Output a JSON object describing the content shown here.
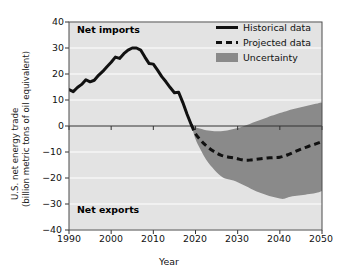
{
  "chart_data": {
    "type": "line",
    "title": "",
    "xlabel": "Year",
    "ylabel": "U.S. net energy trade (billion metric tons of oil equivalent)",
    "ylabel_line1": "U.S. net energy trade",
    "ylabel_line2": "(billion metric tons of oil equivalent)",
    "xlim": [
      1990,
      2050
    ],
    "ylim": [
      -40,
      40
    ],
    "xticks": [
      1990,
      2000,
      2010,
      2020,
      2030,
      2040,
      2050
    ],
    "yticks": [
      40,
      30,
      20,
      10,
      0,
      -10,
      -20,
      -30,
      -40
    ],
    "xtick_labels": [
      "1990",
      "2000",
      "2010",
      "2020",
      "2030",
      "2040",
      "2050"
    ],
    "ytick_labels": [
      "40",
      "30",
      "20",
      "10",
      "0",
      "−10",
      "−20",
      "−30",
      "−40"
    ],
    "grid": "horizontal-white-on-gray",
    "legend_position": "top-right-inside",
    "plot_bg_color": "#e3e3e3",
    "grid_color": "#ffffff",
    "line_color": "#111111",
    "band_color": "#8a8a8a",
    "zone_labels": [
      {
        "text": "Net imports",
        "x": 1992,
        "y": 35
      },
      {
        "text": "Net exports",
        "x": 1992,
        "y": -33
      }
    ],
    "series": [
      {
        "name": "Historical data",
        "style": "solid",
        "x": [
          1990,
          1991,
          1992,
          1993,
          1994,
          1995,
          1996,
          1997,
          1998,
          1999,
          2000,
          2001,
          2002,
          2003,
          2004,
          2005,
          2006,
          2007,
          2008,
          2009,
          2010,
          2011,
          2012,
          2013,
          2014,
          2015,
          2016,
          2017,
          2018,
          2019
        ],
        "values": [
          14.0,
          13.2,
          14.8,
          16.0,
          17.8,
          17.0,
          17.6,
          19.5,
          21.0,
          22.8,
          24.5,
          26.5,
          26.0,
          27.8,
          29.2,
          30.0,
          30.0,
          29.2,
          26.5,
          24.0,
          23.8,
          21.5,
          19.0,
          17.0,
          14.8,
          12.8,
          13.0,
          9.0,
          4.5,
          0.5
        ]
      },
      {
        "name": "Projected data",
        "style": "dashed",
        "x": [
          2019,
          2020,
          2021,
          2022,
          2023,
          2024,
          2025,
          2026,
          2027,
          2028,
          2029,
          2030,
          2031,
          2032,
          2033,
          2034,
          2035,
          2036,
          2037,
          2038,
          2039,
          2040,
          2041,
          2042,
          2043,
          2044,
          2045,
          2046,
          2047,
          2048,
          2049,
          2050
        ],
        "values": [
          0.5,
          -3.0,
          -5.0,
          -6.8,
          -8.2,
          -9.4,
          -10.4,
          -11.2,
          -11.7,
          -12.0,
          -12.2,
          -12.6,
          -13.0,
          -13.2,
          -13.1,
          -12.9,
          -12.7,
          -12.5,
          -12.3,
          -12.2,
          -12.1,
          -12.0,
          -11.6,
          -11.0,
          -10.3,
          -9.6,
          -8.9,
          -8.3,
          -7.7,
          -7.2,
          -6.6,
          -6.0
        ]
      },
      {
        "name": "Uncertainty",
        "style": "band",
        "x": [
          2019,
          2020,
          2021,
          2022,
          2023,
          2024,
          2025,
          2026,
          2027,
          2028,
          2029,
          2030,
          2031,
          2032,
          2033,
          2034,
          2035,
          2036,
          2037,
          2038,
          2039,
          2040,
          2041,
          2042,
          2043,
          2044,
          2045,
          2046,
          2047,
          2048,
          2049,
          2050
        ],
        "upper": [
          0.5,
          -0.5,
          -1.0,
          -1.4,
          -1.7,
          -1.9,
          -2.0,
          -2.0,
          -1.8,
          -1.5,
          -1.2,
          -0.8,
          -0.3,
          0.3,
          0.9,
          1.5,
          2.1,
          2.7,
          3.3,
          3.9,
          4.4,
          5.0,
          5.5,
          6.0,
          6.4,
          6.8,
          7.2,
          7.6,
          8.0,
          8.4,
          8.7,
          9.0
        ],
        "lower": [
          0.5,
          -5.0,
          -8.5,
          -11.5,
          -14.0,
          -16.0,
          -17.8,
          -19.2,
          -20.2,
          -20.6,
          -21.0,
          -21.6,
          -22.4,
          -23.2,
          -24.0,
          -24.8,
          -25.5,
          -26.1,
          -26.6,
          -27.1,
          -27.5,
          -27.9,
          -28.0,
          -27.4,
          -27.0,
          -26.8,
          -26.6,
          -26.4,
          -26.2,
          -26.0,
          -25.6,
          -25.0
        ]
      }
    ]
  },
  "legend": {
    "items": [
      {
        "label": "Historical data",
        "key": "solid-line"
      },
      {
        "label": "Projected data",
        "key": "dashed-line"
      },
      {
        "label": "Uncertainty",
        "key": "filled-patch"
      }
    ]
  }
}
